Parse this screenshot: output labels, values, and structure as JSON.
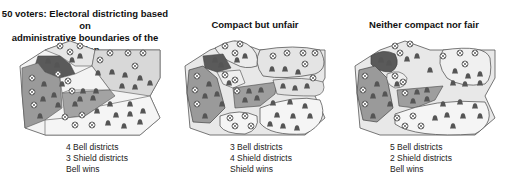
{
  "panels": [
    {
      "title_line1": "50 voters: Electoral districting based on",
      "title_line2": "administrative boundaries of the region",
      "caption": [
        "4 Bell districts",
        "3 Shield districts",
        "Bell wins"
      ]
    },
    {
      "title_line1": "Compact but unfair",
      "title_line2": "",
      "caption": [
        "3 Bell districts",
        "4 Shield districts",
        "Shield wins"
      ]
    },
    {
      "title_line1": "Neither compact nor fair",
      "title_line2": "",
      "caption": [
        "5 Bell districts",
        "2 Shield districts",
        "Bell wins"
      ]
    }
  ],
  "icons": {
    "voter_a": "shield-icon",
    "voter_b": "bell-icon"
  },
  "colors": {
    "dark": "#5a5a5a",
    "mid": "#9a9a9a",
    "light": "#d4d4d4",
    "pale": "#f3f3f3",
    "outline": "#444444",
    "bell": "#555555"
  }
}
